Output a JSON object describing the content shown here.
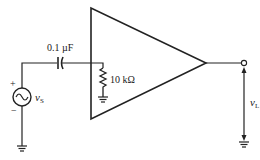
{
  "diagram": {
    "type": "amplifier-circuit",
    "components": {
      "coupling_capacitor": {
        "label": "0.1 µF"
      },
      "input_resistor": {
        "label": "10 kΩ"
      },
      "source": {
        "label_main": "v",
        "label_sub": "S",
        "plus": "+",
        "minus": "−"
      },
      "amplifier": {
        "shape": "triangle"
      },
      "output": {
        "label_main": "v",
        "label_sub": "L"
      }
    },
    "colors": {
      "stroke": "#222222",
      "background": "#ffffff"
    }
  }
}
